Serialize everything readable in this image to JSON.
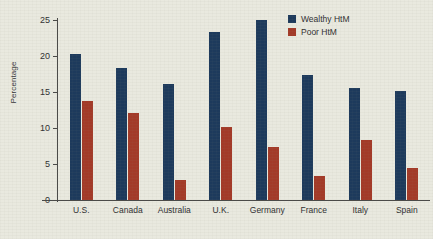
{
  "chart_data": {
    "type": "bar",
    "title": "",
    "xlabel": "",
    "ylabel": "Percentage",
    "ylim": [
      0,
      25
    ],
    "yticks": [
      0,
      5,
      10,
      15,
      20,
      25
    ],
    "ytick_labels": [
      "0",
      "5",
      "10",
      "15",
      "20",
      "25"
    ],
    "grid": false,
    "legend_position": "top-right",
    "categories": [
      "U.S.",
      "Canada",
      "Australia",
      "U.K.",
      "Germany",
      "France",
      "Italy",
      "Spain"
    ],
    "series": [
      {
        "name": "Wealthy HtM",
        "color": "#1d3a5c",
        "values": [
          20.3,
          18.3,
          16.1,
          23.3,
          25.0,
          17.4,
          15.5,
          15.2
        ]
      },
      {
        "name": "Poor HtM",
        "color": "#a33a28",
        "values": [
          13.8,
          12.1,
          2.8,
          10.2,
          7.4,
          3.3,
          8.3,
          4.5
        ]
      }
    ]
  },
  "legend": {
    "items": [
      {
        "label": "Wealthy HtM",
        "color": "#1d3a5c"
      },
      {
        "label": "Poor HtM",
        "color": "#a33a28"
      }
    ]
  },
  "axes": {
    "y_title": "Percentage"
  }
}
